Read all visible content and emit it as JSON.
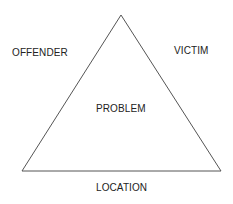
{
  "diagram": {
    "type": "problem-analysis-triangle",
    "labels": {
      "offender": "OFFENDER",
      "victim": "VICTIM",
      "problem": "PROBLEM",
      "location": "LOCATION"
    },
    "triangle": {
      "apex": [
        121,
        15
      ],
      "bottom_left": [
        22,
        171
      ],
      "bottom_right": [
        221,
        171
      ],
      "stroke": "#555555"
    }
  }
}
